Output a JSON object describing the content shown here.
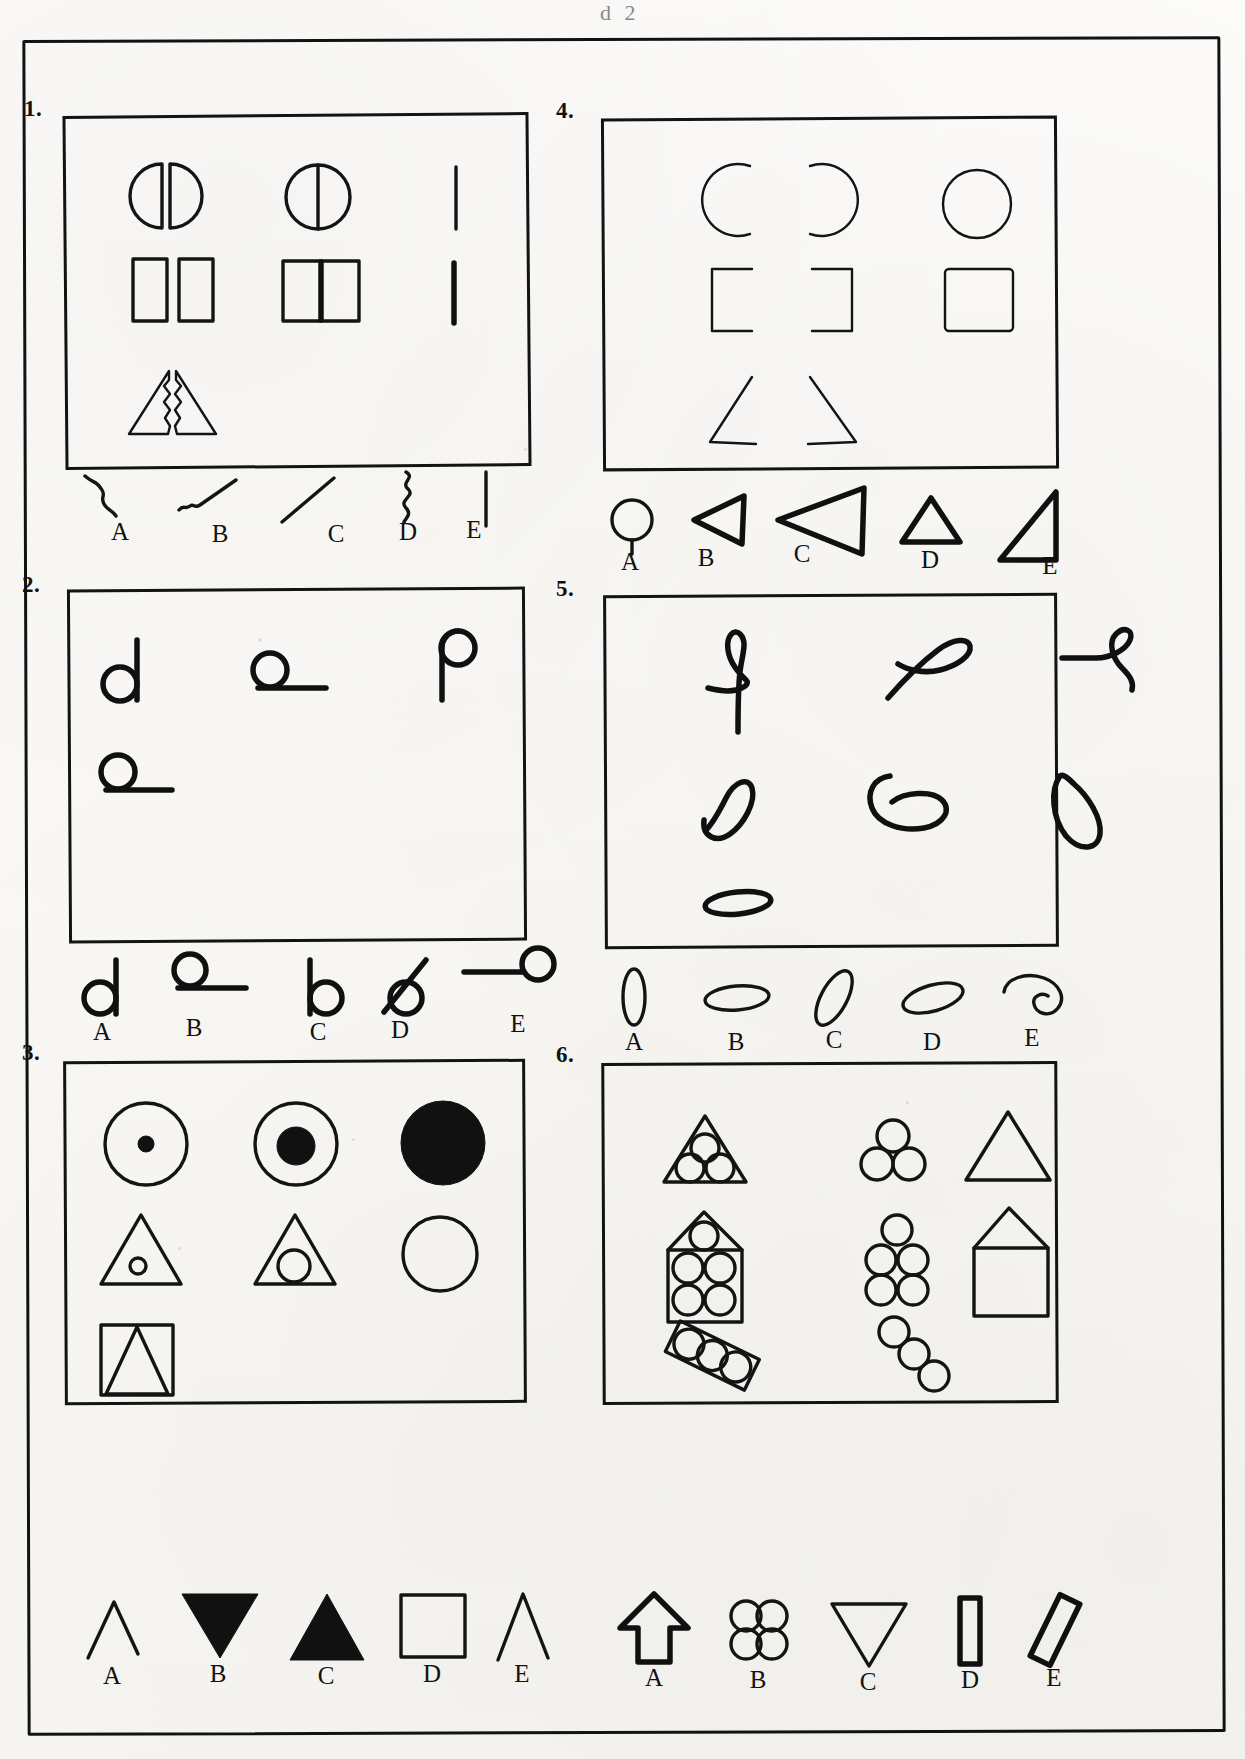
{
  "document": {
    "kind": "visual-analogy-test-sheet",
    "top_partial_mark": "d 2",
    "page_border_color": "#121212",
    "ink_color": "#111111",
    "paper_color": "#faf8f5"
  },
  "items": [
    {
      "number": "1.",
      "stem_rows": [
        [
          "split-circle-halves",
          "circle-with-vertical-diameter",
          "vertical-thin-line"
        ],
        [
          "two-separated-rectangles",
          "rectangle-with-thick-vertical-bar",
          "vertical-thick-bar"
        ],
        [
          "split-triangle-halves",
          "",
          ""
        ]
      ],
      "options": [
        {
          "letter": "A",
          "shape": "zigzag-stroke"
        },
        {
          "letter": "B",
          "shape": "hooked-squiggle-stroke"
        },
        {
          "letter": "C",
          "shape": "diagonal-straight-line"
        },
        {
          "letter": "D",
          "shape": "wavy-vertical-line"
        },
        {
          "letter": "E",
          "shape": "straight-vertical-line"
        }
      ]
    },
    {
      "number": "2.",
      "stem_rows": [
        [
          "circle-with-line-on-right",
          "circle-on-horizontal-line-right",
          "circle-atop-vertical-line"
        ],
        [
          "circle-on-horizontal-line-right",
          "",
          ""
        ]
      ],
      "options": [
        {
          "letter": "A",
          "shape": "circle-with-vertical-line-right"
        },
        {
          "letter": "B",
          "shape": "circle-above-horizontal-line"
        },
        {
          "letter": "C",
          "shape": "circle-with-vertical-line-left"
        },
        {
          "letter": "D",
          "shape": "circle-with-diagonal-line"
        },
        {
          "letter": "E",
          "shape": "circle-with-horizontal-line-left"
        }
      ]
    },
    {
      "number": "3.",
      "stem_rows": [
        [
          "circle-with-tiny-dot",
          "circle-with-medium-dot",
          "filled-black-circle"
        ],
        [
          "triangle-with-tiny-circle",
          "triangle-with-medium-circle",
          "empty-circle"
        ],
        [
          "square-containing-triangle",
          "",
          ""
        ]
      ],
      "options": [
        {
          "letter": "A",
          "shape": "open-chevron-outline"
        },
        {
          "letter": "B",
          "shape": "filled-down-triangle"
        },
        {
          "letter": "C",
          "shape": "filled-up-triangle"
        },
        {
          "letter": "D",
          "shape": "square-outline"
        },
        {
          "letter": "E",
          "shape": "narrow-open-chevron"
        }
      ]
    },
    {
      "number": "4.",
      "stem_rows": [
        [
          "left-open-arc",
          "right-open-arc",
          "closed-circle"
        ],
        [
          "left-bracket",
          "right-bracket",
          "rounded-square"
        ],
        [
          "left-angle",
          "right-angle",
          ""
        ]
      ],
      "options": [
        {
          "letter": "A",
          "shape": "circle-with-stem"
        },
        {
          "letter": "B",
          "shape": "left-pointing-triangle"
        },
        {
          "letter": "C",
          "shape": "large-left-pointing-triangle"
        },
        {
          "letter": "D",
          "shape": "small-up-triangle"
        },
        {
          "letter": "E",
          "shape": "right-angle-triangle"
        }
      ]
    },
    {
      "number": "5.",
      "stem_rows": [
        [
          "upright-loop-with-tail",
          "crossed-loop-diagonal",
          "loop-with-horizontal-tail"
        ],
        [
          "slanted-loop-left",
          "horizontal-loop",
          "slanted-loop-right"
        ],
        [
          "flat-thin-oval",
          "",
          ""
        ]
      ],
      "options": [
        {
          "letter": "A",
          "shape": "vertical-narrow-oval"
        },
        {
          "letter": "B",
          "shape": "horizontal-flat-oval"
        },
        {
          "letter": "C",
          "shape": "diagonal-oval"
        },
        {
          "letter": "D",
          "shape": "tilted-oval"
        },
        {
          "letter": "E",
          "shape": "open-crescent-loop"
        }
      ]
    },
    {
      "number": "6.",
      "stem_rows": [
        [
          "triangle-with-three-circles",
          "three-circles-cluster",
          "empty-triangle"
        ],
        [
          "house-with-seven-circles",
          "seven-circles-cluster",
          "empty-house"
        ],
        [
          "tilted-bar-with-three-circles",
          "three-circles-diagonal",
          ""
        ]
      ],
      "options": [
        {
          "letter": "A",
          "shape": "up-arrow-pentagon"
        },
        {
          "letter": "B",
          "shape": "four-circles-cluster"
        },
        {
          "letter": "C",
          "shape": "down-triangle-outline"
        },
        {
          "letter": "D",
          "shape": "narrow-vertical-bar"
        },
        {
          "letter": "E",
          "shape": "tilted-narrow-bar"
        }
      ]
    }
  ]
}
